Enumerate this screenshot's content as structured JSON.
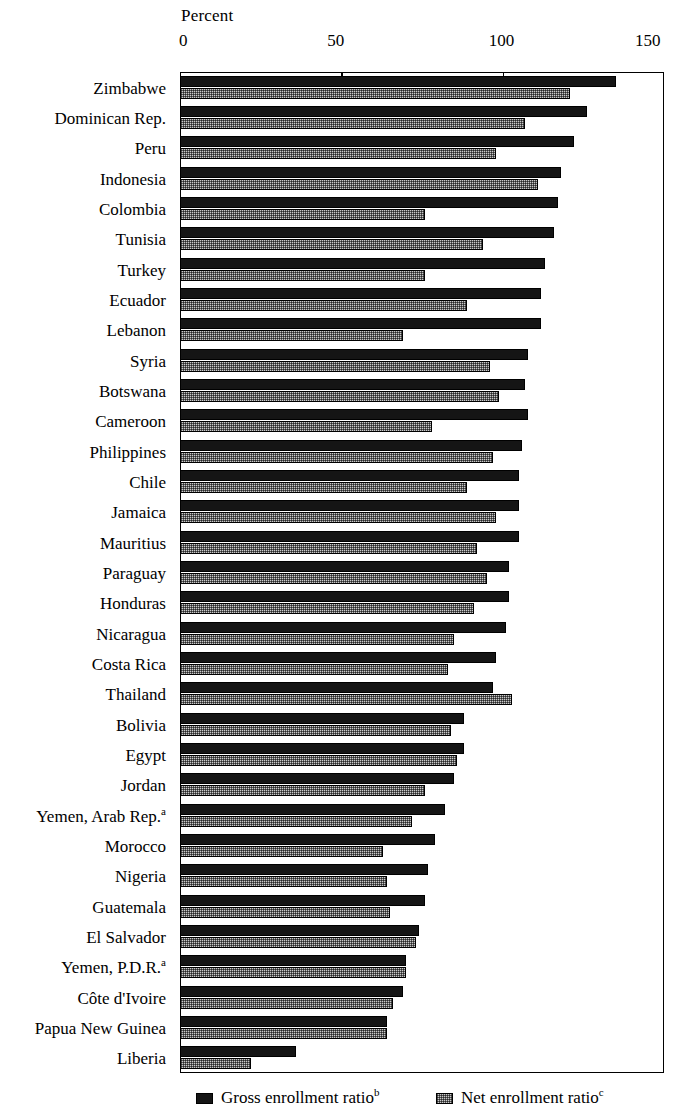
{
  "chart_data": {
    "type": "bar",
    "orientation": "horizontal",
    "title": "",
    "xlabel": "Percent",
    "ylabel": "",
    "xlim": [
      0,
      150
    ],
    "xticks": [
      0,
      50,
      100,
      150
    ],
    "xtick_labels": [
      "0",
      "50",
      "100",
      "150"
    ],
    "grid": false,
    "legend_position": "bottom",
    "categories": [
      "Zimbabwe",
      "Dominican Rep.",
      "Peru",
      "Indonesia",
      "Colombia",
      "Tunisia",
      "Turkey",
      "Ecuador",
      "Lebanon",
      "Syria",
      "Botswana",
      "Cameroon",
      "Philippines",
      "Chile",
      "Jamaica",
      "Mauritius",
      "Paraguay",
      "Honduras",
      "Nicaragua",
      "Costa Rica",
      "Thailand",
      "Bolivia",
      "Egypt",
      "Jordan",
      "Yemen, Arab Rep.",
      "Morocco",
      "Nigeria",
      "Guatemala",
      "El Salvador",
      "Yemen, P.D.R.",
      "Côte d'Ivoire",
      "Papua New Guinea",
      "Liberia"
    ],
    "category_footnotes": {
      "Yemen, Arab Rep.": "a",
      "Yemen, P.D.R.": "a"
    },
    "series": [
      {
        "name": "Gross enrollment ratio",
        "footnote": "b",
        "pattern": "solid-dark",
        "color": "#151515",
        "values": [
          135,
          126,
          122,
          118,
          117,
          116,
          113,
          112,
          112,
          108,
          107,
          108,
          106,
          105,
          105,
          105,
          102,
          102,
          101,
          98,
          97,
          88,
          88,
          85,
          82,
          79,
          77,
          76,
          74,
          70,
          69,
          64,
          36
        ]
      },
      {
        "name": "Net enrollment ratio",
        "footnote": "c",
        "pattern": "dotted-light",
        "color": "#c9c9c9",
        "values": [
          121,
          107,
          98,
          111,
          76,
          94,
          76,
          89,
          69,
          96,
          99,
          78,
          97,
          89,
          98,
          92,
          95,
          91,
          85,
          83,
          103,
          84,
          86,
          76,
          72,
          63,
          64,
          65,
          73,
          70,
          66,
          64,
          22
        ]
      }
    ]
  },
  "legend": {
    "gross_label": "Gross enrollment ratio",
    "gross_footnote": "b",
    "net_label": "Net enrollment ratio",
    "net_footnote": "c"
  }
}
